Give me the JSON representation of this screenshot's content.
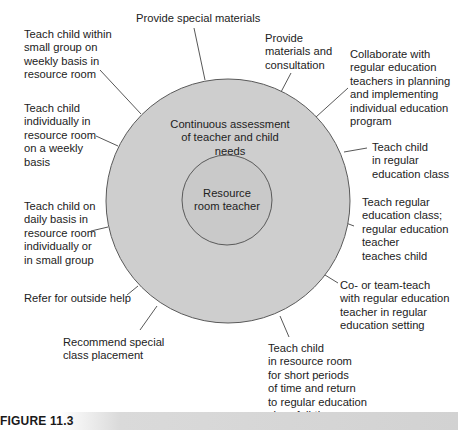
{
  "diagram": {
    "outer_circle": {
      "label": "Continuous assessment\nof teacher and child needs",
      "fill": "#cfcfcf",
      "stroke": "#555555"
    },
    "inner_circle": {
      "label": "Resource\nroom teacher",
      "fill": "#cccccc",
      "stroke": "#555555"
    },
    "spokes": [
      {
        "id": "provide-special-materials",
        "label": "Provide special materials"
      },
      {
        "id": "provide-materials-consultation",
        "label": "Provide\nmaterials and\nconsultation"
      },
      {
        "id": "collaborate",
        "label": "Collaborate with\nregular education\nteachers in planning\nand implementing\nindividual education\nprogram"
      },
      {
        "id": "teach-in-regular-class",
        "label": "Teach child\nin regular\neducation class"
      },
      {
        "id": "teach-regular-class",
        "label": "Teach regular\neducation class;\nregular education\nteacher\nteaches child"
      },
      {
        "id": "co-teach",
        "label": "Co- or team-teach\nwith regular education\nteacher in regular\neducation setting"
      },
      {
        "id": "short-periods",
        "label": "Teach child\nin resource room\nfor short periods\nof time and return\nto regular education\nclass full-time"
      },
      {
        "id": "special-class",
        "label": "Recommend special\nclass placement"
      },
      {
        "id": "outside-help",
        "label": "Refer for outside help"
      },
      {
        "id": "daily-basis",
        "label": "Teach child on\ndaily basis in\nresource room\nindividually or\nin small group"
      },
      {
        "id": "individually-weekly",
        "label": "Teach child\nindividually in\nresource room\non a weekly\nbasis"
      },
      {
        "id": "small-group-weekly",
        "label": "Teach child within\nsmall group on\nweekly basis in\nresource room"
      }
    ]
  },
  "caption": {
    "label": "FIGURE 11.3"
  }
}
